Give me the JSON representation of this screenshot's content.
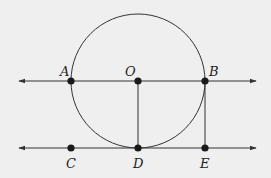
{
  "diagram": {
    "background": "#efefef",
    "stroke_color": "#333333",
    "circle": {
      "cx": 138,
      "cy": 81,
      "r": 67
    },
    "lines": [
      {
        "name": "line-AB",
        "x1": 19,
        "y1": 81,
        "x2": 256,
        "y2": 81,
        "arrows": "both"
      },
      {
        "name": "line-CE",
        "x1": 19,
        "y1": 148,
        "x2": 256,
        "y2": 148,
        "arrows": "both"
      }
    ],
    "segments": [
      {
        "name": "segment-OD",
        "x1": 138,
        "y1": 81,
        "x2": 138,
        "y2": 148
      },
      {
        "name": "segment-BE",
        "x1": 205,
        "y1": 81,
        "x2": 205,
        "y2": 148
      }
    ],
    "points": [
      {
        "label": "A",
        "x": 71,
        "y": 81,
        "lx": 60,
        "ly": 76
      },
      {
        "label": "O",
        "x": 138,
        "y": 81,
        "lx": 125,
        "ly": 76
      },
      {
        "label": "B",
        "x": 205,
        "y": 81,
        "lx": 209,
        "ly": 76
      },
      {
        "label": "C",
        "x": 71,
        "y": 148,
        "lx": 66,
        "ly": 168
      },
      {
        "label": "D",
        "x": 138,
        "y": 148,
        "lx": 133,
        "ly": 168
      },
      {
        "label": "E",
        "x": 205,
        "y": 148,
        "lx": 200,
        "ly": 168
      }
    ]
  }
}
